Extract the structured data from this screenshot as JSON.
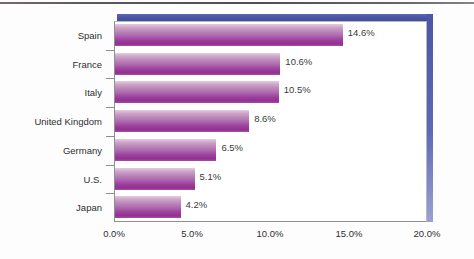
{
  "chart_data": {
    "type": "bar",
    "orientation": "horizontal",
    "title": "",
    "xlabel": "",
    "ylabel": "",
    "categories": [
      "Spain",
      "France",
      "Italy",
      "United Kingdom",
      "Germany",
      "U.S.",
      "Japan"
    ],
    "values": [
      14.6,
      10.6,
      10.5,
      8.6,
      6.5,
      5.1,
      4.2
    ],
    "value_labels": [
      "14.6%",
      "10.6%",
      "10.5%",
      "8.6%",
      "6.5%",
      "5.1%",
      "4.2%"
    ],
    "xlim": [
      0,
      20
    ],
    "xticks": [
      0,
      5,
      10,
      15,
      20
    ],
    "xtick_labels": [
      "0.0%",
      "5.0%",
      "10.0%",
      "15.0%",
      "20.0%"
    ],
    "grid": false,
    "legend": null,
    "colors": {
      "bar_light": "#e5cee1",
      "bar_mid": "#b87ab6",
      "bar_dark": "#932f92",
      "frame_blue": "#4b57a5",
      "axis": "#8e8e93",
      "text": "#2e2e30",
      "background": "#ffffff"
    }
  }
}
